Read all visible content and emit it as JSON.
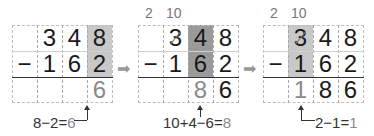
{
  "steps": [
    {
      "rows": [
        [
          "",
          "3",
          "4",
          "8"
        ],
        [
          "−",
          "1",
          "6",
          "2"
        ],
        [
          "",
          "",
          "",
          "6"
        ]
      ],
      "highlight_column": 3,
      "equation": {
        "left": "8−2=",
        "result": "6"
      }
    },
    {
      "carry": {
        "hundreds": "2",
        "tens": "10"
      },
      "rows": [
        [
          "",
          "3",
          "4",
          "8"
        ],
        [
          "−",
          "1",
          "6",
          "2"
        ],
        [
          "",
          "",
          "8",
          "6"
        ]
      ],
      "highlight_column": 2,
      "equation": {
        "left": "10+4−6=",
        "result": "8"
      }
    },
    {
      "carry": {
        "hundreds": "2",
        "tens": "10"
      },
      "rows": [
        [
          "",
          "3",
          "4",
          "8"
        ],
        [
          "−",
          "1",
          "6",
          "2"
        ],
        [
          "",
          "1",
          "8",
          "6"
        ]
      ],
      "highlight_column": 1,
      "equation": {
        "left": "2−1=",
        "result": "1"
      }
    }
  ],
  "arrow_glyph": "➡"
}
